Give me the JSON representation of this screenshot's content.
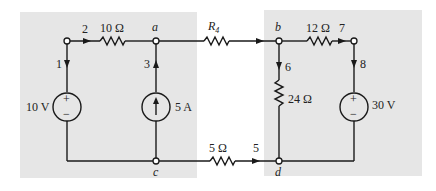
{
  "diagram": {
    "type": "circuit",
    "panels": [
      {
        "name": "left-subcircuit",
        "color": "#e6e6e6"
      },
      {
        "name": "right-subcircuit",
        "color": "#e6e6e6"
      }
    ],
    "nodes": {
      "a": "a",
      "b": "b",
      "c": "c",
      "d": "d"
    },
    "resistors": {
      "r_10": "10 Ω",
      "r_4": "R",
      "r_4_sub": "4",
      "r_12": "12 Ω",
      "r_24": "24 Ω",
      "r_5": "5 Ω"
    },
    "sources": {
      "v_10": "10 V",
      "i_5": "5 A",
      "v_30": "30 V",
      "plus": "+",
      "minus": "−"
    },
    "branches": {
      "b1": "1",
      "b2": "2",
      "b3": "3",
      "b5": "5",
      "b6": "6",
      "b7": "7",
      "b8": "8"
    }
  }
}
